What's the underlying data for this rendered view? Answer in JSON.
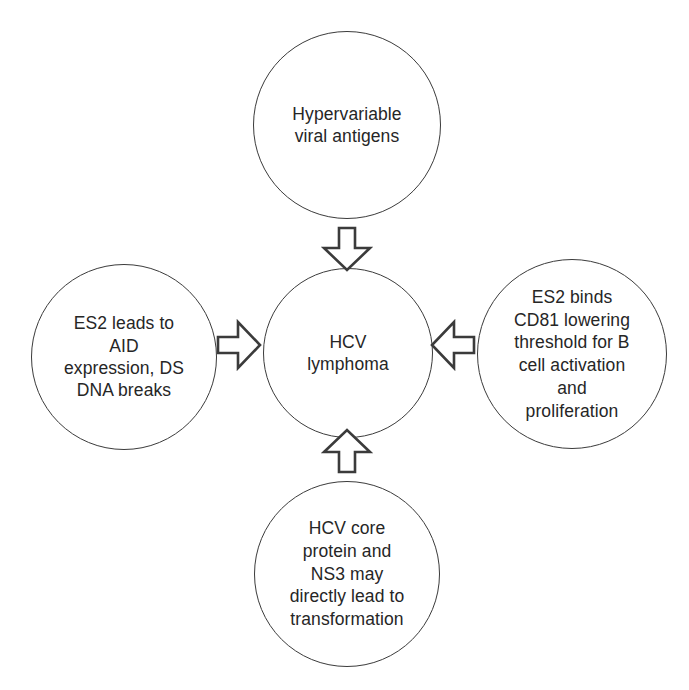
{
  "diagram": {
    "type": "hub-and-spoke",
    "background_color": "#ffffff",
    "stroke_color": "#3b3b3b",
    "text_color": "#262626",
    "center": {
      "id": "hcv-lymphoma",
      "label": "HCV\nlymphoma"
    },
    "nodes": [
      {
        "id": "hypervariable-viral-antigens",
        "position": "top",
        "label": "Hypervariable\nviral antigens"
      },
      {
        "id": "es2-aid-expression",
        "position": "left",
        "label": "ES2 leads to\nAID\nexpression, DS\nDNA breaks"
      },
      {
        "id": "es2-binds-cd81",
        "position": "right",
        "label": "ES2 binds\nCD81 lowering\nthreshold for B\ncell activation\nand\nproliferation"
      },
      {
        "id": "hcv-core-protein-ns3",
        "position": "bottom",
        "label": "HCV core\nprotein and\nNS3 may\ndirectly lead to\ntransformation"
      }
    ],
    "arrows": [
      {
        "id": "top-to-center",
        "direction": "down",
        "from": "hypervariable-viral-antigens",
        "to": "hcv-lymphoma"
      },
      {
        "id": "left-to-center",
        "direction": "right",
        "from": "es2-aid-expression",
        "to": "hcv-lymphoma"
      },
      {
        "id": "right-to-center",
        "direction": "left",
        "from": "es2-binds-cd81",
        "to": "hcv-lymphoma"
      },
      {
        "id": "bottom-to-center",
        "direction": "up",
        "from": "hcv-core-protein-ns3",
        "to": "hcv-lymphoma"
      }
    ]
  }
}
